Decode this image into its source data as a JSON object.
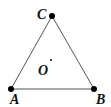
{
  "diagram": {
    "type": "geometry",
    "shape": "triangle",
    "points": [
      {
        "id": "A",
        "label": "A",
        "x": 11,
        "y": 89
      },
      {
        "id": "B",
        "label": "B",
        "x": 94,
        "y": 89
      },
      {
        "id": "C",
        "label": "C",
        "x": 52,
        "y": 16
      },
      {
        "id": "O",
        "label": "O",
        "x": 51,
        "y": 60
      }
    ],
    "edges": [
      [
        "A",
        "B"
      ],
      [
        "B",
        "C"
      ],
      [
        "C",
        "A"
      ]
    ],
    "labels": {
      "A": "A",
      "B": "B",
      "C": "C",
      "O": "O"
    },
    "colors": {
      "stroke": "#555555",
      "point": "#000000"
    }
  }
}
